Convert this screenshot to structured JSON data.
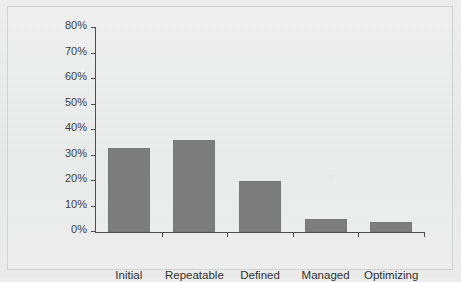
{
  "chart_data": {
    "type": "bar",
    "title": "",
    "subtitle": "",
    "xlabel": "",
    "ylabel": "",
    "categories": [
      "Initial",
      "Repeatable",
      "Defined",
      "Managed",
      "Optimizing"
    ],
    "values": [
      33,
      36,
      20,
      5,
      4
    ],
    "value_labels": [
      "33%",
      "36%",
      "20%",
      "5%",
      "4%"
    ],
    "ylim": [
      0,
      80
    ],
    "ytick_values": [
      0,
      10,
      20,
      30,
      40,
      50,
      60,
      70,
      80
    ],
    "ytick_labels": [
      "0%",
      "10%",
      "20%",
      "30%",
      "40%",
      "50%",
      "60%",
      "70%",
      "80%"
    ],
    "grid": false,
    "legend": false,
    "legend_position": "none",
    "series": [
      {
        "name": "",
        "values": [
          33,
          36,
          20,
          5,
          4
        ]
      }
    ],
    "colors": {
      "bar_fill": "#7d7d7d",
      "axis": "#4c4c4c",
      "background": "#ededed",
      "frame_border": "#d2d3d3",
      "tick_label": "#3c3c3c",
      "category_label": "#2f2f2f"
    }
  }
}
